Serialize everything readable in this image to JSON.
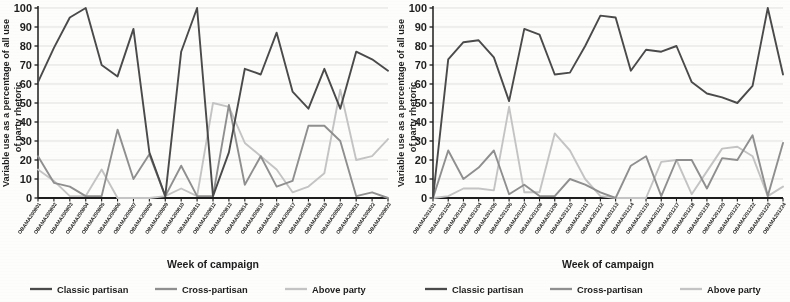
{
  "figure": {
    "panel_count": 2,
    "axis_title_x": "Week of campaign",
    "axis_title_y_line1": "Variable use as a percentage of all use",
    "axis_title_y_line2": "of party rhetoric",
    "colors": {
      "classic_partisan": "#4a4a4a",
      "cross_partisan": "#8f8f8f",
      "above_party": "#c4c4c4",
      "grid": "#cfd6dd",
      "axis": "#1d1d1d",
      "background": "#fdfdfb"
    },
    "legend": {
      "position": "bottom",
      "items": [
        {
          "label": "Classic partisan",
          "color": "#4a4a4a"
        },
        {
          "label": "Cross-partisan",
          "color": "#8f8f8f"
        },
        {
          "label": "Above party",
          "color": "#c4c4c4"
        }
      ]
    }
  },
  "chart_data": [
    {
      "type": "line",
      "title": "",
      "xlabel": "Week of campaign",
      "ylabel": "Variable use as a percentage of all use of party rhetoric",
      "ylim": [
        0,
        100
      ],
      "yticks": [
        0,
        10,
        20,
        30,
        40,
        50,
        60,
        70,
        80,
        90,
        100
      ],
      "grid": true,
      "legend_position": "bottom",
      "categories": [
        "OBAMA2008 01",
        "OBAMA2008 02",
        "OBAMA2008 03",
        "OBAMA2008 04",
        "OBAMA2008 05",
        "OBAMA2008 06",
        "OBAMA2008 07",
        "OBAMA2008 08",
        "OBAMA2008 09",
        "OBAMA2008 10",
        "OBAMA2008 11",
        "OBAMA2008 12",
        "OBAMA2008 13",
        "OBAMA2008 14",
        "OBAMA2008 15",
        "OBAMA2008 16",
        "OBAMA2008 17",
        "OBAMA2008 18",
        "OBAMA2008 19",
        "OBAMA2008 20",
        "OBAMA2008 21",
        "OBAMA2008 22",
        "OBAMA2008 23"
      ],
      "series": [
        {
          "name": "Classic partisan",
          "color": "#4a4a4a",
          "values": [
            61,
            79,
            95,
            100,
            70,
            64,
            89,
            24,
            1,
            77,
            100,
            1,
            24,
            68,
            65,
            87,
            56,
            47,
            68,
            47,
            77,
            73,
            67
          ]
        },
        {
          "name": "Cross-partisan",
          "color": "#8f8f8f",
          "values": [
            22,
            8,
            6,
            1,
            1,
            36,
            10,
            23,
            1,
            17,
            1,
            1,
            49,
            7,
            22,
            6,
            9,
            38,
            38,
            30,
            1,
            3,
            0
          ]
        },
        {
          "name": "Above party",
          "color": "#c4c4c4",
          "values": [
            15,
            9,
            1,
            1,
            15,
            0,
            0,
            0,
            1,
            5,
            1,
            50,
            48,
            29,
            22,
            15,
            3,
            6,
            13,
            57,
            20,
            22,
            31
          ]
        }
      ]
    },
    {
      "type": "line",
      "title": "",
      "xlabel": "Week of campaign",
      "ylabel": "Variable use as a percentage of all use of party rhetoric",
      "ylim": [
        0,
        100
      ],
      "yticks": [
        0,
        10,
        20,
        30,
        40,
        50,
        60,
        70,
        80,
        90,
        100
      ],
      "grid": true,
      "legend_position": "bottom",
      "categories": [
        "OBAMA2012 01",
        "OBAMA2012 02",
        "OBAMA2012 03",
        "OBAMA2012 04",
        "OBAMA2012 05",
        "OBAMA2012 06",
        "OBAMA2012 07",
        "OBAMA2012 08",
        "OBAMA2012 09",
        "OBAMA2012 10",
        "OBAMA2012 11",
        "OBAMA2012 12",
        "OBAMA2012 13",
        "OBAMA2012 14",
        "OBAMA2012 15",
        "OBAMA2012 16",
        "OBAMA2012 17",
        "OBAMA2012 18",
        "OBAMA2012 19",
        "OBAMA2012 20",
        "OBAMA2012 21",
        "OBAMA2012 22",
        "OBAMA2012 23",
        "OBAMA2012 24"
      ],
      "series": [
        {
          "name": "Classic partisan",
          "color": "#4a4a4a",
          "values": [
            0,
            73,
            82,
            83,
            74,
            51,
            89,
            86,
            65,
            66,
            80,
            96,
            95,
            67,
            78,
            77,
            80,
            61,
            55,
            53,
            50,
            59,
            100,
            65
          ]
        },
        {
          "name": "Cross-partisan",
          "color": "#8f8f8f",
          "values": [
            0,
            25,
            10,
            16,
            25,
            2,
            7,
            1,
            1,
            10,
            7,
            3,
            0,
            17,
            22,
            1,
            20,
            20,
            5,
            21,
            20,
            33,
            1,
            29
          ]
        },
        {
          "name": "Above party",
          "color": "#c4c4c4",
          "values": [
            0,
            1,
            5,
            5,
            4,
            48,
            3,
            3,
            34,
            25,
            10,
            1,
            0,
            0,
            0,
            19,
            20,
            2,
            14,
            26,
            27,
            22,
            1,
            6
          ]
        }
      ]
    }
  ]
}
